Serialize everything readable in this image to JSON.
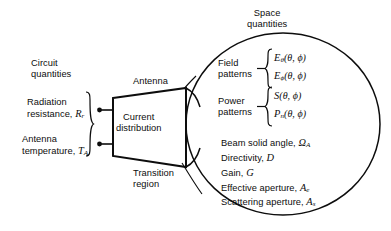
{
  "diagram": {
    "title_circuit": "Circuit\nquantities",
    "title_space": "Space\nquantities",
    "antenna_label": "Antenna",
    "transition_label": "Transition\nregion",
    "box_label": "Current\ndistribution",
    "ink_color": "#0d0d0d",
    "background": "#ffffff"
  },
  "circuit_side": {
    "heading_line1": "Circuit",
    "heading_line2": "quantities",
    "items": [
      {
        "label_line1": "Radiation",
        "label_line2": "resistance,",
        "symbol": "R",
        "subscript": "r"
      },
      {
        "label_line1": "Antenna",
        "label_line2": "temperature,",
        "symbol": "T",
        "subscript": "A"
      }
    ]
  },
  "antenna": {
    "label": "Antenna",
    "box_line1": "Current",
    "box_line2": "distribution",
    "transition_line1": "Transition",
    "transition_line2": "region"
  },
  "space_side": {
    "heading_line1": "Space",
    "heading_line2": "quantities",
    "groups": [
      {
        "name_line1": "Field",
        "name_line2": "patterns",
        "equations": [
          {
            "symbol": "E",
            "subscript": "θ",
            "args": "(θ, ϕ)"
          },
          {
            "symbol": "E",
            "subscript": "ϕ",
            "args": "(θ, ϕ)"
          }
        ]
      },
      {
        "name_line1": "Power",
        "name_line2": "patterns",
        "equations": [
          {
            "symbol": "S",
            "subscript": "",
            "args": "(θ, ϕ)"
          },
          {
            "symbol": "P",
            "subscript": "n",
            "args": "(θ, ϕ)"
          }
        ]
      }
    ],
    "quantities": [
      {
        "text": "Beam solid angle,",
        "symbol": "Ω",
        "subscript": "A"
      },
      {
        "text": "Directivity,",
        "symbol": "D",
        "subscript": ""
      },
      {
        "text": "Gain,",
        "symbol": "G",
        "subscript": ""
      },
      {
        "text": "Effective aperture,",
        "symbol": "A",
        "subscript": "e"
      },
      {
        "text": "Scattering aperture,",
        "symbol": "A",
        "subscript": "s"
      }
    ]
  }
}
